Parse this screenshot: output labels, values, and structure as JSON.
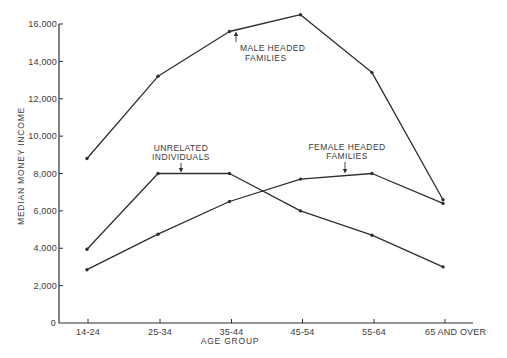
{
  "chart_data": {
    "type": "line",
    "title": "",
    "xlabel": "AGE GROUP",
    "ylabel": "MEDIAN MONEY INCOME",
    "categories": [
      "14-24",
      "25-34",
      "35-44",
      "45-54",
      "55-64",
      "65 AND OVER"
    ],
    "ylim": [
      0,
      16000
    ],
    "yticks": [
      0,
      2000,
      4000,
      6000,
      8000,
      10000,
      12000,
      14000,
      16000
    ],
    "ytick_labels": [
      "0",
      "2,000",
      "4,000",
      "6,000",
      "8,000",
      "10,000",
      "12,000",
      "14,000",
      "16,000"
    ],
    "grid": false,
    "legend": "none (direct annotations with arrows)",
    "series": [
      {
        "name": "MALE HEADED FAMILIES",
        "values": [
          8800,
          13200,
          15600,
          16500,
          13400,
          6600
        ]
      },
      {
        "name": "UNRELATED INDIVIDUALS",
        "values": [
          3950,
          8000,
          8000,
          6000,
          4700,
          3000
        ]
      },
      {
        "name": "FEMALE HEADED FAMILIES",
        "values": [
          2850,
          4750,
          6500,
          7700,
          8000,
          6400
        ]
      }
    ],
    "annotations": [
      {
        "lines": [
          "MALE HEADED",
          "FAMILIES"
        ],
        "points_to": "MALE HEADED FAMILIES near 35-44"
      },
      {
        "lines": [
          "UNRELATED",
          "INDIVIDUALS"
        ],
        "points_to": "UNRELATED INDIVIDUALS between 25-34 and 35-44"
      },
      {
        "lines": [
          "FEMALE HEADED",
          "FAMILIES"
        ],
        "points_to": "FEMALE HEADED FAMILIES between 45-54 and 55-64"
      }
    ]
  },
  "labels": {
    "y_axis_title": "MEDIAN MONEY INCOME",
    "x_axis_title": "AGE GROUP",
    "male_line1": "MALE HEADED",
    "male_line2": "FAMILIES",
    "unrel_line1": "UNRELATED",
    "unrel_line2": "INDIVIDUALS",
    "female_line1": "FEMALE HEADED",
    "female_line2": "FAMILIES"
  },
  "style": {
    "line_color": "#2e2e2e",
    "axis_color": "#2e2e2e",
    "background": "#ffffff"
  }
}
